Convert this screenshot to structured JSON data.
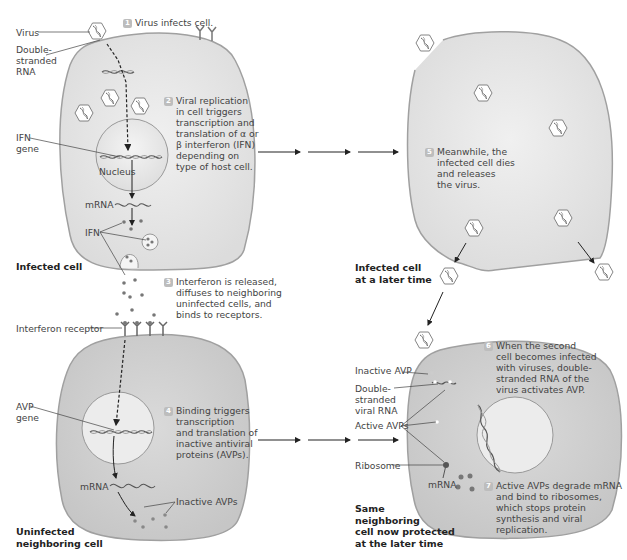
{
  "figure": {
    "credit": "Precision Graphics",
    "colors": {
      "cell_fill": "#e9e9e9",
      "cell_fill_dark": "#cfcfcf",
      "cell_outline": "#9a9a9a",
      "badge": "#bdbdbd",
      "arrow": "#222222"
    }
  },
  "infected_cell": {
    "caption": "Infected cell",
    "labels": {
      "virus": "Virus",
      "dsrna": [
        "Double-",
        "stranded",
        "RNA"
      ],
      "ifn_gene": [
        "IFN",
        "gene"
      ],
      "nucleus": "Nucleus",
      "mrna": "mRNA",
      "ifn": "IFN"
    }
  },
  "steps": [
    {
      "num": "1",
      "lines": [
        "Virus infects cell."
      ]
    },
    {
      "num": "2",
      "lines": [
        "Viral replication",
        "in cell triggers",
        "transcription and",
        "translation of α or",
        "β interferon (IFN)",
        "depending on",
        "type of host cell."
      ]
    },
    {
      "num": "3",
      "lines": [
        "Interferon is released,",
        "diffuses to neighboring",
        "uninfected cells, and",
        "binds to receptors."
      ]
    },
    {
      "num": "4",
      "lines": [
        "Binding triggers",
        "transcription",
        "and translation of",
        "inactive antiviral",
        "proteins (AVPs)."
      ]
    },
    {
      "num": "5",
      "lines": [
        "Meanwhile, the",
        "infected cell dies",
        "and releases",
        "the virus."
      ]
    },
    {
      "num": "6",
      "lines": [
        "When the second",
        "cell becomes infected",
        "with viruses, double-",
        "stranded RNA of the",
        "virus activates AVP."
      ]
    },
    {
      "num": "7",
      "lines": [
        "Active AVPs degrade mRNA",
        "and bind to ribosomes,",
        "which stops protein",
        "synthesis and viral",
        "replication."
      ]
    }
  ],
  "uninfected_cell": {
    "caption": [
      "Uninfected",
      "neighboring cell"
    ],
    "labels": {
      "receptor": "Interferon receptor",
      "avp_gene": [
        "AVP",
        "gene"
      ],
      "mrna": "mRNA",
      "inactive_avps": "Inactive AVPs"
    }
  },
  "later_cell": {
    "caption": [
      "Infected cell",
      "at a later time"
    ]
  },
  "protected_cell": {
    "caption": [
      "Same",
      "neighboring",
      "cell now protected",
      "at the later time"
    ],
    "labels": {
      "inactive_avp": "Inactive AVP",
      "dsrna": [
        "Double-",
        "stranded",
        "viral RNA"
      ],
      "active_avps": "Active AVPs",
      "ribosome": "Ribosome",
      "mrna": "mRNA"
    }
  }
}
